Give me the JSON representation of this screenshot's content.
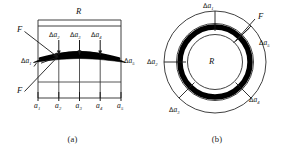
{
  "figure": {
    "panels": [
      {
        "id": "a",
        "caption": "(a)",
        "type": "flat-strip-cross-section",
        "span_label": "R",
        "load_labels": [
          "F",
          "F"
        ],
        "element_labels": [
          {
            "name": "da1",
            "delta": "Δ",
            "base": "a",
            "sub": "1"
          },
          {
            "name": "da2",
            "delta": "Δ",
            "base": "a",
            "sub": "2"
          },
          {
            "name": "da3",
            "delta": "Δ",
            "base": "a",
            "sub": "3"
          },
          {
            "name": "da4",
            "delta": "Δ",
            "base": "a",
            "sub": "4"
          },
          {
            "name": "da5",
            "delta": "Δ",
            "base": "a",
            "sub": "5"
          }
        ],
        "axis_labels": [
          {
            "name": "a1",
            "base": "a",
            "sub": "1"
          },
          {
            "name": "a2",
            "base": "a",
            "sub": "2"
          },
          {
            "name": "a3",
            "base": "a",
            "sub": "3"
          },
          {
            "name": "a4",
            "base": "a",
            "sub": "4"
          },
          {
            "name": "a5",
            "base": "a",
            "sub": "5"
          }
        ]
      },
      {
        "id": "b",
        "caption": "(b)",
        "type": "annular-ring-plan",
        "center_label": "R",
        "load_labels": [
          "F"
        ],
        "element_labels": [
          {
            "name": "da1",
            "delta": "Δ",
            "base": "a",
            "sub": "1"
          },
          {
            "name": "da2",
            "delta": "Δ",
            "base": "a",
            "sub": "2"
          },
          {
            "name": "da3",
            "delta": "Δ",
            "base": "a",
            "sub": "3"
          },
          {
            "name": "da4",
            "delta": "Δ",
            "base": "a",
            "sub": "4"
          },
          {
            "name": "da5",
            "delta": "Δ",
            "base": "a",
            "sub": "5"
          }
        ]
      }
    ],
    "colors": {
      "ink": "#121212",
      "thin_line": "#2b2b2b",
      "band_fill": "#000000",
      "background": "#ffffff"
    }
  }
}
